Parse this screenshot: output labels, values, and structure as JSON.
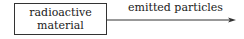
{
  "diagram": {
    "source_box": {
      "lines": [
        "radioactive",
        "material"
      ]
    },
    "arrow": {
      "label": "emitted particles",
      "direction": "right"
    }
  }
}
